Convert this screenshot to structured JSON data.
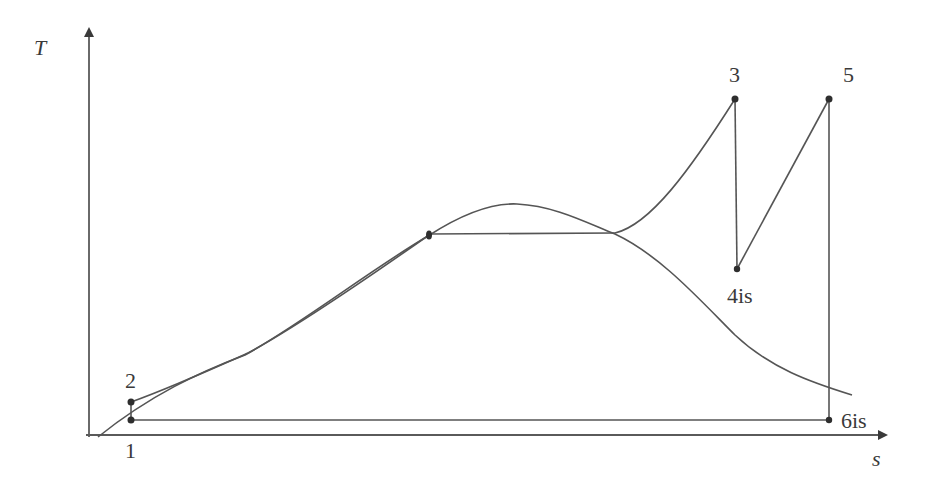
{
  "diagram": {
    "type": "T-s diagram (Rankine cycle with reheat)",
    "axes": {
      "y_label": "T",
      "x_label": "s"
    },
    "points": [
      {
        "id": "1",
        "label": "1"
      },
      {
        "id": "2",
        "label": "2"
      },
      {
        "id": "3",
        "label": "3"
      },
      {
        "id": "4is",
        "label": "4is"
      },
      {
        "id": "5",
        "label": "5"
      },
      {
        "id": "6is",
        "label": "6is"
      }
    ],
    "colors": {
      "line": "#555555",
      "point": "#2e2e2e",
      "text": "#3a3a3a",
      "background": "#ffffff"
    }
  }
}
